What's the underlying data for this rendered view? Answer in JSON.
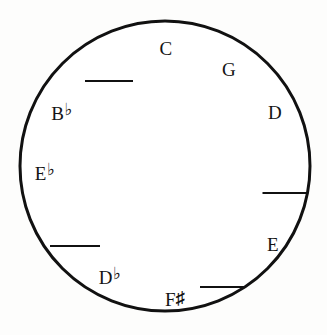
{
  "diagram": {
    "kind": "circle-of-fifths-worksheet",
    "circle": {
      "center_x": 165,
      "center_y": 166,
      "radius": 145,
      "stroke_color": "#111111",
      "stroke_width": 3,
      "fill_color": "#ffffff"
    },
    "background_color": "#fdfdfc",
    "text_color": "#141414"
  },
  "notes": [
    {
      "id": "note-c",
      "letter": "C",
      "accidental": "",
      "accidental_type": "none",
      "x": 166,
      "y": 48
    },
    {
      "id": "note-g",
      "letter": "G",
      "accidental": "",
      "accidental_type": "none",
      "x": 229,
      "y": 69
    },
    {
      "id": "note-d",
      "letter": "D",
      "accidental": "",
      "accidental_type": "none",
      "x": 275,
      "y": 112
    },
    {
      "id": "note-e",
      "letter": "E",
      "accidental": "",
      "accidental_type": "none",
      "x": 273,
      "y": 244
    },
    {
      "id": "note-f-sharp",
      "letter": "F",
      "accidental": "♯",
      "accidental_type": "sharp",
      "x": 175,
      "y": 299
    },
    {
      "id": "note-d-flat",
      "letter": "D",
      "accidental": "♭",
      "accidental_type": "flat",
      "x": 110,
      "y": 276
    },
    {
      "id": "note-e-flat",
      "letter": "E",
      "accidental": "♭",
      "accidental_type": "flat",
      "x": 45,
      "y": 172
    },
    {
      "id": "note-b-flat",
      "letter": "B",
      "accidental": "♭",
      "accidental_type": "flat",
      "x": 62,
      "y": 112
    }
  ],
  "blanks": [
    {
      "id": "blank-upper-left",
      "x": 109,
      "y": 81,
      "width": 48
    },
    {
      "id": "blank-right",
      "x": 285,
      "y": 193,
      "width": 45
    },
    {
      "id": "blank-lower-left",
      "x": 75,
      "y": 246,
      "width": 50
    },
    {
      "id": "blank-bottom-right",
      "x": 223,
      "y": 287,
      "width": 46
    }
  ]
}
